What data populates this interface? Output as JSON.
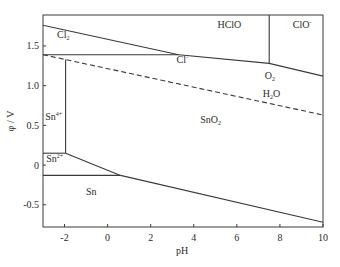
{
  "chart_data": {
    "type": "line",
    "title": "",
    "xlabel": "pH",
    "ylabel": "φ / V",
    "xlim": [
      -3,
      10
    ],
    "ylim": [
      -0.78,
      1.89
    ],
    "grid": false,
    "legend": null,
    "xticks": [
      -2,
      0,
      2,
      4,
      6,
      8,
      10
    ],
    "xtick_labels": [
      "-2",
      "0",
      "2",
      "4",
      "6",
      "8",
      "10"
    ],
    "yticks": [
      -0.5,
      0,
      0.5,
      1.0,
      1.5
    ],
    "ytick_labels": [
      "-0.5",
      "0",
      "0.5",
      "1.0",
      "1.5"
    ],
    "series": [
      {
        "name": "Cl2/Cl- and Cl2/HClO boundary",
        "style": "solid",
        "points": [
          [
            -3,
            1.76
          ],
          [
            3.3,
            1.39
          ]
        ]
      },
      {
        "name": "Cl- lower boundary of Cl2",
        "style": "solid",
        "points": [
          [
            -3,
            1.39
          ],
          [
            3.3,
            1.39
          ]
        ]
      },
      {
        "name": "Cl-/HClO and Cl-/ClO- boundary",
        "style": "solid",
        "points": [
          [
            3.3,
            1.39
          ],
          [
            7.5,
            1.28
          ],
          [
            10,
            1.12
          ]
        ]
      },
      {
        "name": "HClO/ClO- boundary",
        "style": "solid",
        "points": [
          [
            7.5,
            1.89
          ],
          [
            7.5,
            1.28
          ]
        ]
      },
      {
        "name": "O2/H2O",
        "style": "dashed",
        "points": [
          [
            -3,
            1.39
          ],
          [
            10,
            0.63
          ]
        ]
      },
      {
        "name": "Sn4+/SnO2",
        "style": "solid",
        "points": [
          [
            -1.95,
            1.33
          ],
          [
            -1.95,
            0.15
          ]
        ]
      },
      {
        "name": "Sn4+/Sn2+",
        "style": "solid",
        "points": [
          [
            -3,
            0.15
          ],
          [
            -1.95,
            0.15
          ]
        ]
      },
      {
        "name": "Sn2+/SnO2",
        "style": "solid",
        "points": [
          [
            -1.95,
            0.15
          ],
          [
            0.6,
            -0.13
          ]
        ]
      },
      {
        "name": "Sn/Sn2+",
        "style": "solid",
        "points": [
          [
            -3,
            -0.13
          ],
          [
            0.6,
            -0.13
          ]
        ]
      },
      {
        "name": "Sn/SnO2",
        "style": "solid",
        "points": [
          [
            0.6,
            -0.13
          ],
          [
            10,
            -0.72
          ]
        ]
      }
    ],
    "annotations": [
      {
        "text": "Cl",
        "sub": "2",
        "sup": "",
        "x": -2.35,
        "y": 1.6
      },
      {
        "text": "HClO",
        "sub": "",
        "sup": "",
        "x": 5.1,
        "y": 1.72
      },
      {
        "text": "ClO",
        "sub": "",
        "sup": "-",
        "x": 8.6,
        "y": 1.72
      },
      {
        "text": "Cl",
        "sub": "",
        "sup": "-",
        "x": 3.2,
        "y": 1.29
      },
      {
        "text": "O",
        "sub": "2",
        "sup": "",
        "x": 7.3,
        "y": 1.08
      },
      {
        "text": "H",
        "sub": "2",
        "sup": "",
        "suffix": "O",
        "x": 7.2,
        "y": 0.86
      },
      {
        "text": "Sn",
        "sub": "",
        "sup": "4+",
        "x": -2.9,
        "y": 0.57
      },
      {
        "text": "SnO",
        "sub": "2",
        "sup": "",
        "x": 4.3,
        "y": 0.53
      },
      {
        "text": "Sn",
        "sub": "",
        "sup": "2+",
        "x": -2.85,
        "y": 0.04
      },
      {
        "text": "Sn",
        "sub": "",
        "sup": "",
        "x": -1.0,
        "y": -0.38
      }
    ]
  },
  "plot_area": {
    "left": 43,
    "top": 15,
    "right": 323,
    "bottom": 227
  },
  "colors": {
    "line": "#3a3a3a",
    "text": "#2a2a2a",
    "background": "#ffffff"
  }
}
